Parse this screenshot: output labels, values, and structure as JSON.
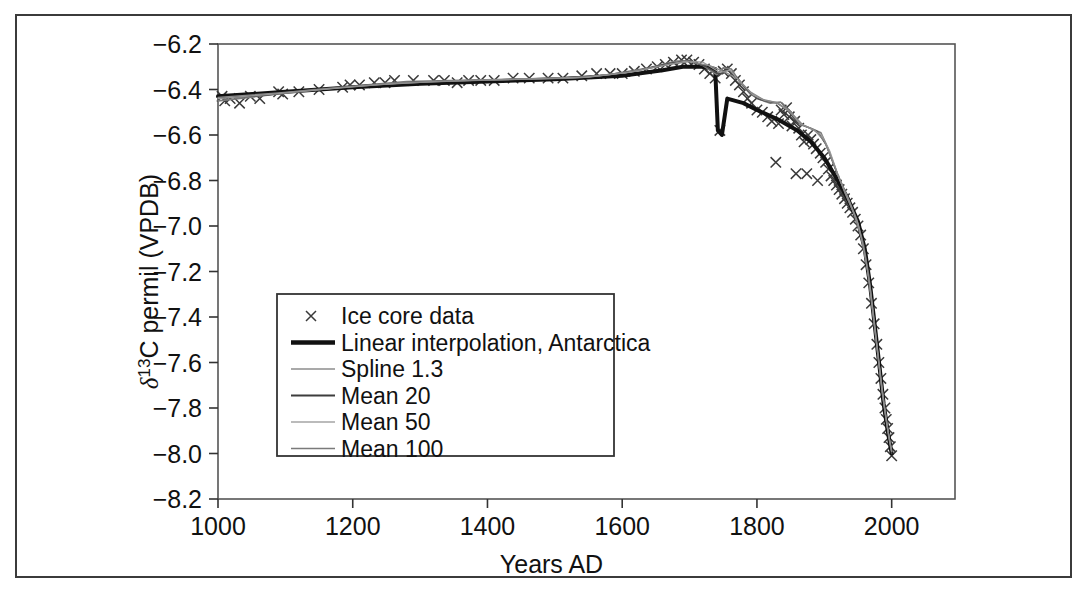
{
  "figure": {
    "has_outer_border": true,
    "background": "#ffffff",
    "line_color_dark": "#111111",
    "line_color_mid": "#5a5a5a",
    "line_color_light": "#8c8c8c"
  },
  "chart_data": {
    "type": "line",
    "title": "",
    "xlabel": "Years AD",
    "ylabel": "δ¹³C permil (VPDB)",
    "ylabel_parts": {
      "delta": "δ",
      "superscript": "13",
      "rest": "C permil (VPDB)"
    },
    "xlim": [
      1000,
      2094
    ],
    "ylim": [
      -8.2,
      -6.2
    ],
    "xticks": [
      1000,
      1200,
      1400,
      1600,
      1800,
      2000
    ],
    "xtick_labels": [
      "1000",
      "1200",
      "1400",
      "1600",
      "1800",
      "2000"
    ],
    "yticks": [
      -6.2,
      -6.4,
      -6.6,
      -6.8,
      -7.0,
      -7.2,
      -7.4,
      -7.6,
      -7.8,
      -8.0,
      -8.2
    ],
    "ytick_labels": [
      "−6.2",
      "−6.4",
      "−6.6",
      "−6.8",
      "−7.0",
      "−7.2",
      "−7.4",
      "−7.6",
      "−7.8",
      "−8.0",
      "−8.2"
    ],
    "grid": false,
    "legend_position": "center-left",
    "series": [
      {
        "name": "Ice core data",
        "style": "scatter",
        "marker": "x",
        "color": "#3a3a3a",
        "points": [
          [
            1006,
            -6.43
          ],
          [
            1010,
            -6.45
          ],
          [
            1018,
            -6.44
          ],
          [
            1032,
            -6.46
          ],
          [
            1048,
            -6.43
          ],
          [
            1062,
            -6.44
          ],
          [
            1090,
            -6.41
          ],
          [
            1096,
            -6.42
          ],
          [
            1120,
            -6.41
          ],
          [
            1150,
            -6.4
          ],
          [
            1185,
            -6.39
          ],
          [
            1196,
            -6.38
          ],
          [
            1210,
            -6.38
          ],
          [
            1232,
            -6.37
          ],
          [
            1248,
            -6.37
          ],
          [
            1262,
            -6.36
          ],
          [
            1290,
            -6.36
          ],
          [
            1320,
            -6.36
          ],
          [
            1336,
            -6.36
          ],
          [
            1355,
            -6.37
          ],
          [
            1372,
            -6.36
          ],
          [
            1390,
            -6.36
          ],
          [
            1410,
            -6.36
          ],
          [
            1438,
            -6.35
          ],
          [
            1462,
            -6.35
          ],
          [
            1490,
            -6.35
          ],
          [
            1512,
            -6.35
          ],
          [
            1540,
            -6.34
          ],
          [
            1562,
            -6.33
          ],
          [
            1582,
            -6.33
          ],
          [
            1600,
            -6.33
          ],
          [
            1618,
            -6.32
          ],
          [
            1636,
            -6.31
          ],
          [
            1652,
            -6.3
          ],
          [
            1664,
            -6.29
          ],
          [
            1676,
            -6.28
          ],
          [
            1688,
            -6.27
          ],
          [
            1696,
            -6.27
          ],
          [
            1706,
            -6.28
          ],
          [
            1714,
            -6.29
          ],
          [
            1722,
            -6.31
          ],
          [
            1730,
            -6.33
          ],
          [
            1738,
            -6.35
          ],
          [
            1745,
            -6.58
          ],
          [
            1750,
            -6.32
          ],
          [
            1756,
            -6.31
          ],
          [
            1762,
            -6.33
          ],
          [
            1768,
            -6.36
          ],
          [
            1774,
            -6.38
          ],
          [
            1780,
            -6.41
          ],
          [
            1786,
            -6.44
          ],
          [
            1792,
            -6.46
          ],
          [
            1800,
            -6.49
          ],
          [
            1808,
            -6.5
          ],
          [
            1816,
            -6.52
          ],
          [
            1822,
            -6.54
          ],
          [
            1828,
            -6.72
          ],
          [
            1832,
            -6.55
          ],
          [
            1836,
            -6.49
          ],
          [
            1840,
            -6.51
          ],
          [
            1844,
            -6.48
          ],
          [
            1848,
            -6.52
          ],
          [
            1852,
            -6.56
          ],
          [
            1856,
            -6.54
          ],
          [
            1858,
            -6.77
          ],
          [
            1862,
            -6.57
          ],
          [
            1866,
            -6.6
          ],
          [
            1870,
            -6.63
          ],
          [
            1874,
            -6.77
          ],
          [
            1876,
            -6.6
          ],
          [
            1880,
            -6.62
          ],
          [
            1884,
            -6.64
          ],
          [
            1888,
            -6.66
          ],
          [
            1890,
            -6.8
          ],
          [
            1894,
            -6.68
          ],
          [
            1898,
            -6.7
          ],
          [
            1902,
            -6.72
          ],
          [
            1906,
            -6.75
          ],
          [
            1910,
            -6.78
          ],
          [
            1914,
            -6.8
          ],
          [
            1918,
            -6.82
          ],
          [
            1922,
            -6.84
          ],
          [
            1926,
            -6.86
          ],
          [
            1930,
            -6.88
          ],
          [
            1934,
            -6.9
          ],
          [
            1938,
            -6.92
          ],
          [
            1942,
            -6.94
          ],
          [
            1946,
            -6.97
          ],
          [
            1950,
            -7.0
          ],
          [
            1954,
            -7.04
          ],
          [
            1958,
            -7.1
          ],
          [
            1962,
            -7.17
          ],
          [
            1966,
            -7.25
          ],
          [
            1970,
            -7.34
          ],
          [
            1974,
            -7.43
          ],
          [
            1978,
            -7.52
          ],
          [
            1981,
            -7.6
          ],
          [
            1984,
            -7.67
          ],
          [
            1987,
            -7.74
          ],
          [
            1990,
            -7.8
          ],
          [
            1992,
            -7.85
          ],
          [
            1994,
            -7.89
          ],
          [
            1996,
            -7.93
          ],
          [
            1998,
            -7.97
          ],
          [
            2000,
            -8.01
          ]
        ]
      },
      {
        "name": "Linear interpolation, Antarctica",
        "style": "line",
        "width": 4,
        "color": "#111111",
        "points": [
          [
            1000,
            -6.43
          ],
          [
            1100,
            -6.41
          ],
          [
            1200,
            -6.39
          ],
          [
            1300,
            -6.375
          ],
          [
            1400,
            -6.365
          ],
          [
            1500,
            -6.355
          ],
          [
            1600,
            -6.34
          ],
          [
            1660,
            -6.315
          ],
          [
            1690,
            -6.3
          ],
          [
            1720,
            -6.3
          ],
          [
            1738,
            -6.31
          ],
          [
            1742,
            -6.58
          ],
          [
            1748,
            -6.6
          ],
          [
            1756,
            -6.44
          ],
          [
            1780,
            -6.46
          ],
          [
            1800,
            -6.49
          ],
          [
            1830,
            -6.53
          ],
          [
            1860,
            -6.58
          ],
          [
            1880,
            -6.63
          ],
          [
            1900,
            -6.7
          ],
          [
            1920,
            -6.8
          ],
          [
            1935,
            -6.88
          ],
          [
            1950,
            -6.98
          ],
          [
            1960,
            -7.1
          ],
          [
            1968,
            -7.26
          ],
          [
            1975,
            -7.44
          ],
          [
            1982,
            -7.62
          ],
          [
            1988,
            -7.78
          ],
          [
            1993,
            -7.88
          ],
          [
            1997,
            -7.95
          ],
          [
            2000,
            -8.0
          ]
        ]
      },
      {
        "name": "Spline 1.3",
        "style": "line",
        "width": 1.6,
        "color": "#7a7a7a",
        "points": [
          [
            1000,
            -6.45
          ],
          [
            1060,
            -6.43
          ],
          [
            1120,
            -6.41
          ],
          [
            1200,
            -6.385
          ],
          [
            1280,
            -6.365
          ],
          [
            1360,
            -6.36
          ],
          [
            1440,
            -6.355
          ],
          [
            1520,
            -6.35
          ],
          [
            1580,
            -6.335
          ],
          [
            1640,
            -6.305
          ],
          [
            1680,
            -6.275
          ],
          [
            1700,
            -6.275
          ],
          [
            1720,
            -6.295
          ],
          [
            1740,
            -6.335
          ],
          [
            1750,
            -6.305
          ],
          [
            1762,
            -6.31
          ],
          [
            1775,
            -6.37
          ],
          [
            1790,
            -6.42
          ],
          [
            1805,
            -6.445
          ],
          [
            1820,
            -6.46
          ],
          [
            1835,
            -6.455
          ],
          [
            1850,
            -6.5
          ],
          [
            1865,
            -6.555
          ],
          [
            1880,
            -6.57
          ],
          [
            1895,
            -6.59
          ],
          [
            1905,
            -6.655
          ],
          [
            1920,
            -6.775
          ],
          [
            1935,
            -6.875
          ],
          [
            1948,
            -6.97
          ],
          [
            1958,
            -7.08
          ],
          [
            1966,
            -7.22
          ],
          [
            1974,
            -7.42
          ],
          [
            1981,
            -7.6
          ],
          [
            1987,
            -7.745
          ],
          [
            1992,
            -7.85
          ],
          [
            1996,
            -7.93
          ],
          [
            2000,
            -7.99
          ]
        ]
      },
      {
        "name": "Mean 20",
        "style": "line",
        "width": 1.4,
        "color": "#4a4a4a",
        "points": [
          [
            1000,
            -6.44
          ],
          [
            1070,
            -6.425
          ],
          [
            1140,
            -6.4
          ],
          [
            1210,
            -6.383
          ],
          [
            1280,
            -6.37
          ],
          [
            1350,
            -6.362
          ],
          [
            1420,
            -6.357
          ],
          [
            1490,
            -6.352
          ],
          [
            1560,
            -6.342
          ],
          [
            1620,
            -6.318
          ],
          [
            1670,
            -6.285
          ],
          [
            1700,
            -6.272
          ],
          [
            1725,
            -6.3
          ],
          [
            1745,
            -6.335
          ],
          [
            1756,
            -6.315
          ],
          [
            1770,
            -6.345
          ],
          [
            1785,
            -6.4
          ],
          [
            1800,
            -6.44
          ],
          [
            1815,
            -6.452
          ],
          [
            1830,
            -6.46
          ],
          [
            1845,
            -6.49
          ],
          [
            1860,
            -6.545
          ],
          [
            1875,
            -6.565
          ],
          [
            1890,
            -6.585
          ],
          [
            1902,
            -6.64
          ],
          [
            1918,
            -6.76
          ],
          [
            1932,
            -6.86
          ],
          [
            1945,
            -6.955
          ],
          [
            1956,
            -7.06
          ],
          [
            1965,
            -7.2
          ],
          [
            1973,
            -7.4
          ],
          [
            1980,
            -7.58
          ],
          [
            1986,
            -7.73
          ],
          [
            1991,
            -7.84
          ],
          [
            1996,
            -7.93
          ],
          [
            2000,
            -8.0
          ]
        ]
      },
      {
        "name": "Mean 50",
        "style": "line",
        "width": 1.3,
        "color": "#9a9a9a",
        "points": [
          [
            1000,
            -6.44
          ],
          [
            1080,
            -6.42
          ],
          [
            1160,
            -6.398
          ],
          [
            1240,
            -6.378
          ],
          [
            1320,
            -6.365
          ],
          [
            1400,
            -6.358
          ],
          [
            1480,
            -6.352
          ],
          [
            1550,
            -6.345
          ],
          [
            1610,
            -6.325
          ],
          [
            1660,
            -6.295
          ],
          [
            1695,
            -6.275
          ],
          [
            1720,
            -6.28
          ],
          [
            1745,
            -6.325
          ],
          [
            1760,
            -6.315
          ],
          [
            1778,
            -6.375
          ],
          [
            1795,
            -6.425
          ],
          [
            1812,
            -6.448
          ],
          [
            1830,
            -6.458
          ],
          [
            1848,
            -6.495
          ],
          [
            1864,
            -6.55
          ],
          [
            1880,
            -6.572
          ],
          [
            1896,
            -6.6
          ],
          [
            1908,
            -6.67
          ],
          [
            1922,
            -6.79
          ],
          [
            1936,
            -6.885
          ],
          [
            1950,
            -6.99
          ],
          [
            1960,
            -7.12
          ],
          [
            1968,
            -7.27
          ],
          [
            1976,
            -7.47
          ],
          [
            1983,
            -7.65
          ],
          [
            1989,
            -7.79
          ],
          [
            1994,
            -7.89
          ],
          [
            1998,
            -7.96
          ],
          [
            2000,
            -7.99
          ]
        ]
      },
      {
        "name": "Mean 100",
        "style": "line",
        "width": 1.3,
        "color": "#8a8a8a",
        "points": [
          [
            1000,
            -6.435
          ],
          [
            1090,
            -6.415
          ],
          [
            1180,
            -6.392
          ],
          [
            1270,
            -6.372
          ],
          [
            1360,
            -6.362
          ],
          [
            1450,
            -6.355
          ],
          [
            1540,
            -6.348
          ],
          [
            1615,
            -6.322
          ],
          [
            1670,
            -6.29
          ],
          [
            1700,
            -6.277
          ],
          [
            1730,
            -6.295
          ],
          [
            1750,
            -6.32
          ],
          [
            1770,
            -6.35
          ],
          [
            1790,
            -6.41
          ],
          [
            1810,
            -6.445
          ],
          [
            1830,
            -6.458
          ],
          [
            1850,
            -6.5
          ],
          [
            1868,
            -6.555
          ],
          [
            1885,
            -6.577
          ],
          [
            1900,
            -6.625
          ],
          [
            1915,
            -6.735
          ],
          [
            1930,
            -6.85
          ],
          [
            1944,
            -6.945
          ],
          [
            1955,
            -7.05
          ],
          [
            1964,
            -7.19
          ],
          [
            1972,
            -7.385
          ],
          [
            1980,
            -7.58
          ],
          [
            1986,
            -7.735
          ],
          [
            1992,
            -7.855
          ],
          [
            1997,
            -7.945
          ],
          [
            2000,
            -7.99
          ]
        ]
      }
    ]
  },
  "legend": {
    "items": [
      {
        "label": "Ice core data",
        "type": "marker",
        "marker": "x",
        "color": "#3a3a3a"
      },
      {
        "label": "Linear interpolation, Antarctica",
        "type": "line",
        "width": 4.5,
        "color": "#111111"
      },
      {
        "label": "Spline 1.3",
        "type": "line",
        "width": 1.6,
        "color": "#8c8c8c"
      },
      {
        "label": "Mean 20",
        "type": "line",
        "width": 1.8,
        "color": "#3d3d3d"
      },
      {
        "label": "Mean 50",
        "type": "line",
        "width": 1.4,
        "color": "#a5a5a5"
      },
      {
        "label": "Mean 100",
        "type": "line",
        "width": 1.6,
        "color": "#7a7a7a"
      }
    ]
  }
}
